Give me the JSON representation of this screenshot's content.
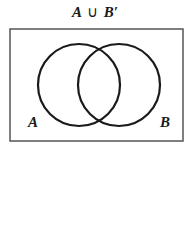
{
  "title": {
    "left": "A",
    "operator": "∪",
    "right": "B′"
  },
  "universe": {
    "x": 10,
    "y": 29,
    "width": 173,
    "height": 112,
    "stroke": "#555555"
  },
  "circles": [
    {
      "name": "A",
      "cx": 79,
      "cy": 85,
      "r": 41,
      "stroke": "#1a1a1a"
    },
    {
      "name": "B",
      "cx": 119,
      "cy": 85,
      "r": 41,
      "stroke": "#1a1a1a"
    }
  ],
  "labels": {
    "a": "A",
    "b": "B"
  }
}
